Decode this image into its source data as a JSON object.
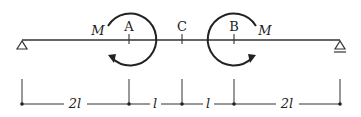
{
  "diagram": {
    "type": "beam",
    "points": {
      "A": "A",
      "B": "B",
      "C": "C"
    },
    "moments": [
      {
        "label": "M",
        "at": "A",
        "direction": "counterclockwise"
      },
      {
        "label": "M",
        "at": "B",
        "direction": "clockwise"
      }
    ],
    "supports": [
      "left-pin",
      "right-roller"
    ],
    "dimensions": [
      "2l",
      "l",
      "l",
      "2l"
    ]
  }
}
